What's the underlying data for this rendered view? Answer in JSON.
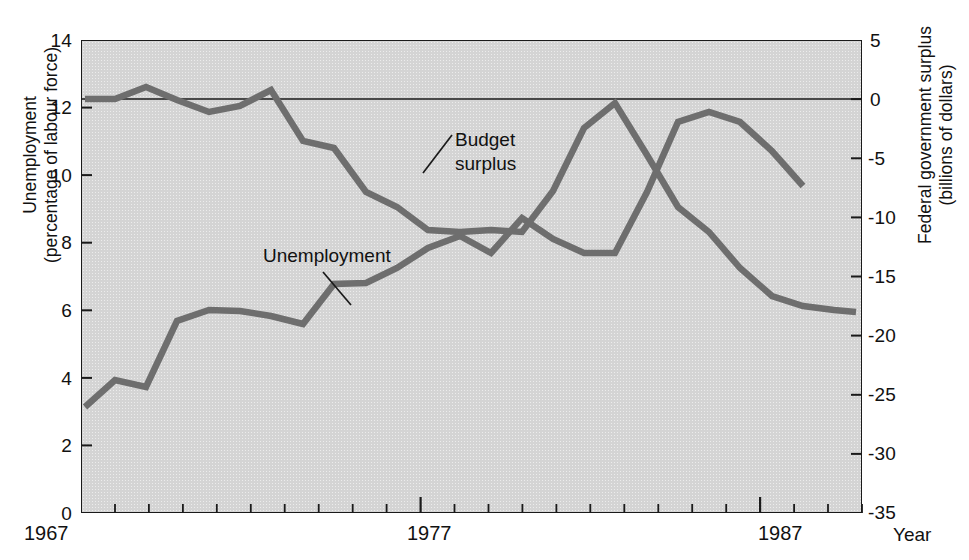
{
  "chart_data": {
    "type": "line",
    "title": "",
    "xlabel": "Year",
    "x_ticks_labeled": [
      "1967",
      "1977",
      "1987"
    ],
    "x_range": [
      1967,
      1990
    ],
    "grid": false,
    "legend_position": "inline-annotations",
    "axes": {
      "left": {
        "label_line1": "Unemployment",
        "label_line2": "(percentage of labour force)",
        "ticks": [
          "14",
          "12",
          "10",
          "8",
          "6",
          "4",
          "2",
          "0"
        ],
        "range": [
          0,
          14
        ]
      },
      "right": {
        "label_line1": "Federal government surplus",
        "label_line2": "(billions of dollars)",
        "ticks": [
          "5",
          "0",
          "-5",
          "-10",
          "-15",
          "-20",
          "-25",
          "-30",
          "-35"
        ],
        "range": [
          -35,
          5
        ]
      }
    },
    "annotations": [
      {
        "name": "budget-surplus-label",
        "line1": "Budget",
        "line2": "surplus"
      },
      {
        "name": "unemployment-label",
        "line1": "Unemployment",
        "line2": ""
      }
    ],
    "series": [
      {
        "name": "Unemployment",
        "axis": "left",
        "color": "#6e6e6e",
        "x": [
          1967,
          1968,
          1969,
          1970,
          1971,
          1972,
          1973,
          1974,
          1975,
          1976,
          1977,
          1978,
          1979,
          1980,
          1981,
          1982,
          1983,
          1984,
          1985,
          1986,
          1987,
          1988,
          1989,
          1990
        ],
        "values": [
          3.7,
          4.4,
          4.1,
          5.9,
          6.2,
          6.2,
          6.0,
          5.7,
          6.9,
          6.9,
          7.3,
          7.9,
          8.3,
          7.7,
          8.9,
          8.4,
          7.8,
          7.8,
          8.6,
          5.3,
          4.3,
          3.0,
          1.4,
          4.2
        ]
      },
      {
        "name": "Budget surplus",
        "axis": "right",
        "color": "#6e6e6e",
        "x": [
          1967,
          1968,
          1969,
          1970,
          1971,
          1972,
          1973,
          1974,
          1975,
          1976,
          1977,
          1978,
          1979,
          1980,
          1981,
          1982,
          1983,
          1984,
          1985,
          1986,
          1987,
          1988,
          1989,
          1990
        ],
        "values": [
          0.0,
          0.0,
          0.8,
          -0.1,
          -1.0,
          -0.6,
          0.6,
          -3.8,
          -4.4,
          -9.2,
          -10.5,
          -12.5,
          -12.7,
          -12.5,
          -12.7,
          -8.9,
          -3.5,
          -1.0,
          -4.5,
          -9.0,
          -11.0,
          -13.5,
          -15.8,
          -16.5
        ]
      }
    ],
    "pixel_geometry": {
      "plot": {
        "left": 81,
        "top": 40,
        "right": 862,
        "bottom": 513
      },
      "unemployment_points": [
        [
          85,
          407
        ],
        [
          115,
          380
        ],
        [
          146,
          387
        ],
        [
          177,
          321
        ],
        [
          209,
          310
        ],
        [
          240,
          311
        ],
        [
          271,
          316
        ],
        [
          303,
          324
        ],
        [
          334,
          284
        ],
        [
          366,
          283
        ],
        [
          397,
          268
        ],
        [
          428,
          248
        ],
        [
          460,
          236
        ],
        [
          491,
          253
        ],
        [
          522,
          218
        ],
        [
          553,
          239
        ],
        [
          584,
          253
        ],
        [
          615,
          253
        ],
        [
          647,
          192
        ],
        [
          678,
          122
        ],
        [
          709,
          112
        ],
        [
          740,
          122
        ],
        [
          772,
          151
        ],
        [
          803,
          186
        ]
      ],
      "surplus_points": [
        [
          85,
          99
        ],
        [
          115,
          99
        ],
        [
          146,
          87
        ],
        [
          177,
          100
        ],
        [
          209,
          112
        ],
        [
          240,
          106
        ],
        [
          271,
          90
        ],
        [
          303,
          141
        ],
        [
          334,
          148
        ],
        [
          366,
          192
        ],
        [
          397,
          207
        ],
        [
          428,
          230
        ],
        [
          460,
          232
        ],
        [
          491,
          230
        ],
        [
          522,
          232
        ],
        [
          553,
          191
        ],
        [
          584,
          128
        ],
        [
          615,
          103
        ],
        [
          647,
          155
        ],
        [
          678,
          207
        ],
        [
          709,
          232
        ],
        [
          740,
          268
        ],
        [
          772,
          296
        ],
        [
          803,
          306
        ],
        [
          834,
          310
        ],
        [
          856,
          312
        ]
      ]
    }
  },
  "x_axis": {
    "label_1967": "1967",
    "label_1977": "1977",
    "label_1987": "1987",
    "name": "Year"
  }
}
